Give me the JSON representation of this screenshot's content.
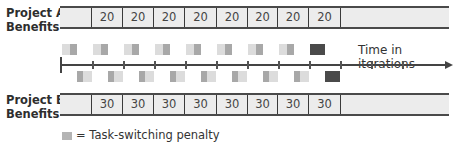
{
  "project_a": {
    "label_line1": "Project A",
    "label_line2": "Benefits",
    "cells": [
      "",
      "20",
      "20",
      "20",
      "20",
      "20",
      "20",
      "20",
      "20",
      ""
    ]
  },
  "project_b": {
    "label_line1": "Project B",
    "label_line2": "Benefits",
    "cells": [
      "",
      "30",
      "30",
      "30",
      "30",
      "30",
      "30",
      "30",
      "30",
      ""
    ]
  },
  "timeline": {
    "title": "Time in iterations",
    "ticks": 12
  },
  "penalty_blocks": {
    "project_a_count": 8,
    "project_b_count": 8,
    "final_block_style": "dark"
  },
  "legend": {
    "symbol": "■",
    "text": "= Task-switching penalty"
  },
  "colors": {
    "bar_fill": "#ececec",
    "bar_border": "#4a4a4a",
    "penalty_light": "#dcdcdc",
    "penalty_mid": "#a8a8a8",
    "penalty_dark": "#4a4a4a"
  }
}
